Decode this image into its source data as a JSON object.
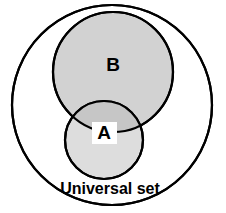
{
  "diagram": {
    "type": "venn",
    "background_color": "#ffffff",
    "stroke_color": "#000000",
    "labels": {
      "universal": "Universal set",
      "set_a": "A",
      "set_b": "B"
    },
    "sets": [
      {
        "name": "universal",
        "label": "Universal set",
        "cx": 112,
        "cy": 105,
        "r": 100,
        "fill": "#ffffff",
        "stroke": "#000000",
        "stroke_width": 2.2
      },
      {
        "name": "set-b",
        "label": "B",
        "cx": 113,
        "cy": 72,
        "r": 60,
        "fill": "#d2d2d2",
        "stroke": "#000000",
        "stroke_width": 2.2
      },
      {
        "name": "set-a",
        "label": "A",
        "cx": 104,
        "cy": 140,
        "r": 39,
        "fill": "#dddddd",
        "stroke": "#000000",
        "stroke_width": 2.2
      }
    ],
    "intersection": {
      "name": "a-intersect-b",
      "fill": "#c6c6c6"
    },
    "label_positions": {
      "set_b": {
        "x": 113,
        "y": 66
      },
      "set_a": {
        "x": 104,
        "y": 137
      },
      "universal": {
        "x": 110,
        "y": 190
      }
    },
    "label_plate": {
      "x": 92,
      "y": 122,
      "width": 25,
      "height": 22,
      "fill": "#ffffff"
    },
    "colors": {
      "set_b_fill": "#d2d2d2",
      "set_a_fill": "#dddddd",
      "intersection_fill": "#c6c6c6",
      "outline": "#000000",
      "background": "#ffffff"
    }
  }
}
